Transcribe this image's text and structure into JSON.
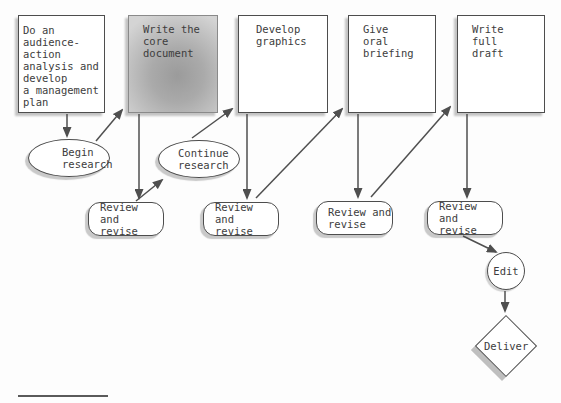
{
  "figure": {
    "steps": [
      {
        "id": "plan",
        "label": "Do an\naudience-\naction\nanalysis and\ndevelop\na management\nplan",
        "highlighted": false
      },
      {
        "id": "write-core",
        "label": "Write the\ncore\ndocument",
        "highlighted": true
      },
      {
        "id": "develop-graphics",
        "label": "Develop\ngraphics",
        "highlighted": false
      },
      {
        "id": "give-briefing",
        "label": "Give\noral\nbriefing",
        "highlighted": false
      },
      {
        "id": "write-draft",
        "label": "Write\nfull\ndraft",
        "highlighted": false
      }
    ],
    "research_ovals": [
      {
        "id": "begin-research",
        "label": "Begin\nresearch"
      },
      {
        "id": "continue-research",
        "label": "Continue\nresearch"
      }
    ],
    "review_nodes": [
      {
        "id": "review-revise-1",
        "label": "Review and\nrevise"
      },
      {
        "id": "review-revise-2",
        "label": "Review and\nrevise"
      },
      {
        "id": "review-revise-3",
        "label": "Review and\nrevise"
      },
      {
        "id": "review-revise-4",
        "label": "Review and\nrevise"
      }
    ],
    "edit": {
      "id": "edit",
      "label": "Edit"
    },
    "deliver": {
      "id": "deliver",
      "label": "Deliver"
    },
    "flow_edges": [
      {
        "from": "plan",
        "to": "begin-research"
      },
      {
        "from": "begin-research",
        "to": "write-core"
      },
      {
        "from": "write-core",
        "to": "review-revise-1"
      },
      {
        "from": "review-revise-1",
        "to": "continue-research"
      },
      {
        "from": "continue-research",
        "to": "develop-graphics"
      },
      {
        "from": "develop-graphics",
        "to": "review-revise-2"
      },
      {
        "from": "review-revise-2",
        "to": "give-briefing"
      },
      {
        "from": "give-briefing",
        "to": "review-revise-3"
      },
      {
        "from": "review-revise-3",
        "to": "write-draft"
      },
      {
        "from": "write-draft",
        "to": "review-revise-4"
      },
      {
        "from": "review-revise-4",
        "to": "edit"
      },
      {
        "from": "edit",
        "to": "deliver"
      }
    ],
    "colors": {
      "node_border": "#4d4d4d",
      "arrow": "#4f4f4f",
      "text": "#3d3d3d",
      "shadow": "#c3c3c3",
      "highlight_fill_center": "#9b9b9b",
      "highlight_fill_edge": "#d4d4d4"
    }
  }
}
